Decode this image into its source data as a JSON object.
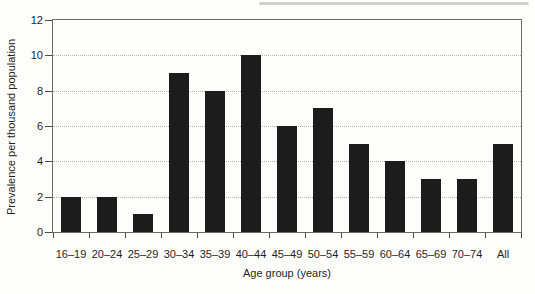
{
  "chart_data": {
    "type": "bar",
    "title": "",
    "categories": [
      "16–19",
      "20–24",
      "25–29",
      "30–34",
      "35–39",
      "40–44",
      "45–49",
      "50–54",
      "55–59",
      "60–64",
      "65–69",
      "70–74",
      "All"
    ],
    "values": [
      2,
      2,
      1,
      9,
      8,
      10,
      6,
      7,
      5,
      4,
      3,
      3,
      5
    ],
    "xlabel": "Age group (years)",
    "ylabel": "Prevalence per thousand population",
    "ylim": [
      0,
      12
    ],
    "yticks": [
      0,
      2,
      4,
      6,
      8,
      10,
      12
    ],
    "gridline_values": [
      2,
      4,
      6,
      8,
      10
    ],
    "grid_style": "dotted",
    "legend": null,
    "frame": "full-box"
  },
  "colors": {
    "bar": "#1c1c1c",
    "grid": "#b3b3b3",
    "axis_frame": "#6b6b6b",
    "tick": "#4a4a4a",
    "text": "#1f1f1f",
    "background": "#fdfdfc",
    "scan_artifact": "#cfcfcf"
  }
}
